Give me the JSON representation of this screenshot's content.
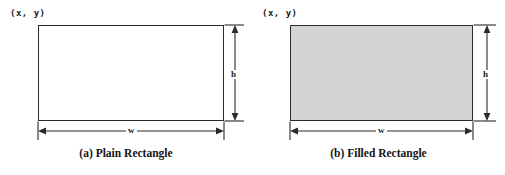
{
  "figure": {
    "background_color": "#ffffff",
    "line_color": "#2b2b2b",
    "text_color": "#1a1a1a",
    "fill_color": "#d4d4d4"
  },
  "panels": [
    {
      "id": "a",
      "caption": "(a) Plain Rectangle",
      "origin_label": "(x, y)",
      "width_label": "w",
      "height_label": "h",
      "fill": "none"
    },
    {
      "id": "b",
      "caption": "(b) Filled Rectangle",
      "origin_label": "(x, y)",
      "width_label": "w",
      "height_label": "h",
      "fill": "#d4d4d4"
    }
  ]
}
